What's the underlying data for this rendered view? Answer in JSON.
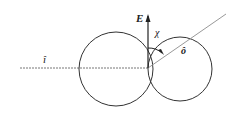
{
  "diagram": {
    "labels": {
      "incident": "î",
      "field": "E",
      "angle": "χ",
      "outgoing": "ô"
    },
    "colors": {
      "stroke": "#333333",
      "guide": "#999999",
      "text": "#222222"
    }
  }
}
